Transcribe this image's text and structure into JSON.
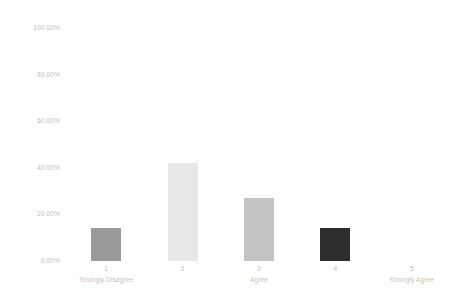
{
  "chart_data": {
    "type": "bar",
    "title": "",
    "subtitle": "",
    "xlabel": "",
    "ylabel": "",
    "categories": [
      "1",
      "2",
      "3",
      "4",
      "5"
    ],
    "category_sublabels": [
      "Strongly Disagree",
      "",
      "Agree",
      "",
      "Strongly Agree"
    ],
    "values": [
      14.0,
      42.0,
      27.0,
      14.0,
      0.0
    ],
    "value_labels": [
      "14.00%",
      "42.00%",
      "27.00%",
      "14.00%",
      "0.00%"
    ],
    "ylim": [
      0,
      100
    ],
    "y_ticks": [
      100,
      80,
      60,
      40,
      20,
      0
    ],
    "y_tick_labels": [
      "100.00%",
      "80.00%",
      "60.00%",
      "40.00%",
      "20.00%",
      "0.00%"
    ],
    "grid": false,
    "legend": false,
    "legend_position": "none",
    "bar_colors": [
      "#9a9a9a",
      "#e8e8e8",
      "#c4c4c4",
      "#2d2d2d",
      "#fafafa"
    ],
    "axis_text_color": "#bdbdbd",
    "background_color": "#ffffff"
  }
}
